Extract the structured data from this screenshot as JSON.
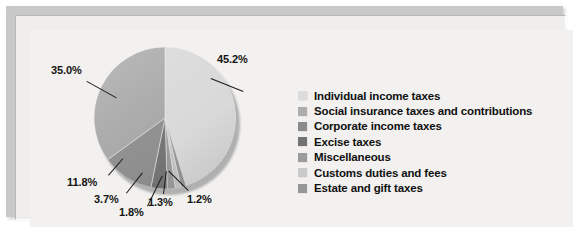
{
  "chart_data": {
    "type": "pie",
    "title": "",
    "subtitle": "",
    "xlabel": "",
    "ylabel": "",
    "legend_position": "right",
    "grid": false,
    "categories": [
      "Individual income taxes",
      "Social insurance taxes and contributions",
      "Corporate income taxes",
      "Excise taxes",
      "Miscellaneous",
      "Customs duties and fees",
      "Estate and gift taxes"
    ],
    "values": [
      45.2,
      35.0,
      11.8,
      3.7,
      1.8,
      1.3,
      1.2
    ],
    "value_labels": [
      "45.2%",
      "35.0%",
      "11.8%",
      "3.7%",
      "1.8%",
      "1.3%",
      "1.2%"
    ],
    "colors": [
      "#d9d9d9",
      "#a8a8a8",
      "#8f8f8f",
      "#767676",
      "#9d9d9d",
      "#c6c6c6",
      "#999999"
    ],
    "slice_order_clockwise_from_top": [
      {
        "label": "Individual income taxes",
        "value": 45.2,
        "value_label": "45.2%",
        "color": "#d9d9d9"
      },
      {
        "label": "Estate and gift taxes",
        "value": 1.2,
        "value_label": "1.2%",
        "color": "#999999"
      },
      {
        "label": "Customs duties and fees",
        "value": 1.3,
        "value_label": "1.3%",
        "color": "#c6c6c6"
      },
      {
        "label": "Miscellaneous",
        "value": 1.8,
        "value_label": "1.8%",
        "color": "#9d9d9d"
      },
      {
        "label": "Excise taxes",
        "value": 3.7,
        "value_label": "3.7%",
        "color": "#767676"
      },
      {
        "label": "Corporate income taxes",
        "value": 11.8,
        "value_label": "11.8%",
        "color": "#8f8f8f"
      },
      {
        "label": "Social insurance taxes and contributions",
        "value": 35.0,
        "value_label": "35.0%",
        "color": "#a8a8a8"
      }
    ]
  },
  "legend": {
    "items": [
      {
        "label": "Individual income taxes",
        "color": "#dcdcdc"
      },
      {
        "label": "Social insurance taxes and contributions",
        "color": "#adadad"
      },
      {
        "label": "Corporate income taxes",
        "color": "#8b8b8b"
      },
      {
        "label": "Excise taxes",
        "color": "#737373"
      },
      {
        "label": "Miscellaneous",
        "color": "#9c9c9c"
      },
      {
        "label": "Customs duties and fees",
        "color": "#cacaca"
      },
      {
        "label": "Estate and gift taxes",
        "color": "#979797"
      }
    ]
  },
  "labels": {
    "p1": "45.2%",
    "p2": "35.0%",
    "p3": "11.8%",
    "p4": "3.7%",
    "p5": "1.8%",
    "p6": "1.3%",
    "p7": "1.2%"
  },
  "theme": {
    "panel_background": "#f2f1ef",
    "frame_border": "#c9c9c9",
    "text_color": "#101010"
  }
}
